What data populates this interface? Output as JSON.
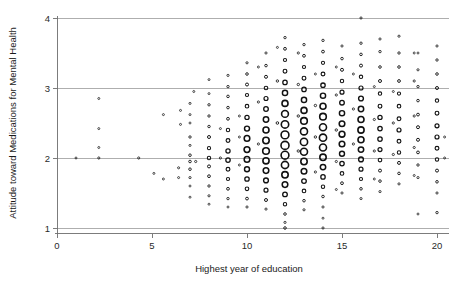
{
  "chart_data": {
    "type": "scatter",
    "title": "",
    "xlabel": "Highest year of education",
    "ylabel": "Attitude toward Medications for Mental Health",
    "xlim": [
      0,
      20.6
    ],
    "ylim": [
      1,
      4
    ],
    "xticks": [
      0,
      5,
      10,
      15,
      20
    ],
    "xticklabels": [
      "0",
      "5",
      "10",
      "15",
      "20"
    ],
    "yticks": [
      1,
      2,
      3,
      4
    ],
    "yticklabels": [
      "1",
      "2",
      "3",
      "4"
    ],
    "grid": "horizontal gridlines at each y tick",
    "legend": "none",
    "marker": "open circle, variable radius (weighted / overplotted)",
    "note": "jittered scatter; density concentrated at education 11-17 and attitude 2.0-3.0",
    "points": [
      [
        1.0,
        2.0,
        2.0
      ],
      [
        2.2,
        2.85,
        2.0
      ],
      [
        2.2,
        2.42,
        2.0
      ],
      [
        2.2,
        2.15,
        2.0
      ],
      [
        2.2,
        2.0,
        2.2
      ],
      [
        4.3,
        2.0,
        2.2
      ],
      [
        5.1,
        1.78,
        2.0
      ],
      [
        5.6,
        2.62,
        2.0
      ],
      [
        5.6,
        1.7,
        2.0
      ],
      [
        6.5,
        2.68,
        2.0
      ],
      [
        6.5,
        2.48,
        2.0
      ],
      [
        6.4,
        1.86,
        2.1
      ],
      [
        6.4,
        1.72,
        2.0
      ],
      [
        7.0,
        2.78,
        2.1
      ],
      [
        7.0,
        2.62,
        2.0
      ],
      [
        7.0,
        2.5,
        2.0
      ],
      [
        7.0,
        2.3,
        2.4
      ],
      [
        7.0,
        2.18,
        2.1
      ],
      [
        7.0,
        2.04,
        2.6
      ],
      [
        7.0,
        1.95,
        2.6
      ],
      [
        7.0,
        1.84,
        2.6
      ],
      [
        7.0,
        1.72,
        2.2
      ],
      [
        7.0,
        1.6,
        2.0
      ],
      [
        7.0,
        1.44,
        2.0
      ],
      [
        7.2,
        2.95,
        2.0
      ],
      [
        7.3,
        1.95,
        2.2
      ],
      [
        8.0,
        3.12,
        2.0
      ],
      [
        8.0,
        2.92,
        2.0
      ],
      [
        8.0,
        2.76,
        2.4
      ],
      [
        8.0,
        2.6,
        2.4
      ],
      [
        8.0,
        2.45,
        2.5
      ],
      [
        8.0,
        2.3,
        3.0
      ],
      [
        8.0,
        2.14,
        3.2
      ],
      [
        8.0,
        2.0,
        3.4
      ],
      [
        8.0,
        1.88,
        3.0
      ],
      [
        8.0,
        1.74,
        2.8
      ],
      [
        8.0,
        1.6,
        2.4
      ],
      [
        8.0,
        1.46,
        2.2
      ],
      [
        8.0,
        1.34,
        2.0
      ],
      [
        8.6,
        2.42,
        2.0
      ],
      [
        8.6,
        2.0,
        2.2
      ],
      [
        9.0,
        3.18,
        2.2
      ],
      [
        9.0,
        3.02,
        2.4
      ],
      [
        9.0,
        2.88,
        2.6
      ],
      [
        9.0,
        2.72,
        2.6
      ],
      [
        9.0,
        2.56,
        2.8
      ],
      [
        9.0,
        2.4,
        3.4
      ],
      [
        9.0,
        2.25,
        3.8
      ],
      [
        9.0,
        2.1,
        4.2
      ],
      [
        9.0,
        1.97,
        4.4
      ],
      [
        9.0,
        1.84,
        3.8
      ],
      [
        9.0,
        1.7,
        3.2
      ],
      [
        9.0,
        1.56,
        2.8
      ],
      [
        9.0,
        1.42,
        2.4
      ],
      [
        9.0,
        1.3,
        2.0
      ],
      [
        9.6,
        2.6,
        2.0
      ],
      [
        9.6,
        2.3,
        2.0
      ],
      [
        9.6,
        1.9,
        2.0
      ],
      [
        10.0,
        3.36,
        2.2
      ],
      [
        10.0,
        3.2,
        2.6
      ],
      [
        10.0,
        3.05,
        3.0
      ],
      [
        10.0,
        2.9,
        3.2
      ],
      [
        10.0,
        2.74,
        3.6
      ],
      [
        10.0,
        2.58,
        4.2
      ],
      [
        10.0,
        2.42,
        5.0
      ],
      [
        10.0,
        2.28,
        5.6
      ],
      [
        10.0,
        2.12,
        5.8
      ],
      [
        10.0,
        1.98,
        5.6
      ],
      [
        10.0,
        1.84,
        5.0
      ],
      [
        10.0,
        1.7,
        4.4
      ],
      [
        10.0,
        1.56,
        3.6
      ],
      [
        10.0,
        1.42,
        2.8
      ],
      [
        10.0,
        1.3,
        2.2
      ],
      [
        10.6,
        3.3,
        2.0
      ],
      [
        10.6,
        2.8,
        2.2
      ],
      [
        10.6,
        2.2,
        2.2
      ],
      [
        11.0,
        3.5,
        2.2
      ],
      [
        11.0,
        3.32,
        2.6
      ],
      [
        11.0,
        3.16,
        3.0
      ],
      [
        11.0,
        3.0,
        3.6
      ],
      [
        11.0,
        2.85,
        4.0
      ],
      [
        11.0,
        2.7,
        4.6
      ],
      [
        11.0,
        2.55,
        5.4
      ],
      [
        11.0,
        2.4,
        6.0
      ],
      [
        11.0,
        2.25,
        6.4
      ],
      [
        11.0,
        2.1,
        6.6
      ],
      [
        11.0,
        1.96,
        6.2
      ],
      [
        11.0,
        1.82,
        5.6
      ],
      [
        11.0,
        1.68,
        4.8
      ],
      [
        11.0,
        1.54,
        4.0
      ],
      [
        11.0,
        1.4,
        3.0
      ],
      [
        11.0,
        1.27,
        2.2
      ],
      [
        11.6,
        3.58,
        2.0
      ],
      [
        11.6,
        3.1,
        2.4
      ],
      [
        11.6,
        2.5,
        2.6
      ],
      [
        12.0,
        3.72,
        2.4
      ],
      [
        12.0,
        3.56,
        2.8
      ],
      [
        12.0,
        3.4,
        3.2
      ],
      [
        12.0,
        3.24,
        3.8
      ],
      [
        12.0,
        3.08,
        4.4
      ],
      [
        12.0,
        2.93,
        5.2
      ],
      [
        12.0,
        2.78,
        6.0
      ],
      [
        12.0,
        2.63,
        6.8
      ],
      [
        12.0,
        2.48,
        7.4
      ],
      [
        12.0,
        2.33,
        7.8
      ],
      [
        12.0,
        2.18,
        8.0
      ],
      [
        12.0,
        2.04,
        7.8
      ],
      [
        12.0,
        1.9,
        7.2
      ],
      [
        12.0,
        1.76,
        6.4
      ],
      [
        12.0,
        1.62,
        5.6
      ],
      [
        12.0,
        1.48,
        4.6
      ],
      [
        12.0,
        1.34,
        3.4
      ],
      [
        12.0,
        1.2,
        2.6
      ],
      [
        12.0,
        1.08,
        2.2
      ],
      [
        12.0,
        1.0,
        2.6
      ],
      [
        12.7,
        3.5,
        2.2
      ],
      [
        12.7,
        3.05,
        2.4
      ],
      [
        12.7,
        2.6,
        2.4
      ],
      [
        12.7,
        2.1,
        2.4
      ],
      [
        13.0,
        3.62,
        2.4
      ],
      [
        13.0,
        3.46,
        2.8
      ],
      [
        13.0,
        3.3,
        3.2
      ],
      [
        13.0,
        3.14,
        3.8
      ],
      [
        13.0,
        2.98,
        4.4
      ],
      [
        13.0,
        2.83,
        5.2
      ],
      [
        13.0,
        2.68,
        6.0
      ],
      [
        13.0,
        2.53,
        6.6
      ],
      [
        13.0,
        2.38,
        7.0
      ],
      [
        13.0,
        2.23,
        7.2
      ],
      [
        13.0,
        2.09,
        7.0
      ],
      [
        13.0,
        1.95,
        6.4
      ],
      [
        13.0,
        1.81,
        5.6
      ],
      [
        13.0,
        1.67,
        4.6
      ],
      [
        13.0,
        1.53,
        3.6
      ],
      [
        13.0,
        1.39,
        2.6
      ],
      [
        13.0,
        1.26,
        2.2
      ],
      [
        13.6,
        3.2,
        2.0
      ],
      [
        13.6,
        2.75,
        2.4
      ],
      [
        13.6,
        2.3,
        2.4
      ],
      [
        13.6,
        1.8,
        2.2
      ],
      [
        14.0,
        3.68,
        2.4
      ],
      [
        14.0,
        3.52,
        2.8
      ],
      [
        14.0,
        3.36,
        3.2
      ],
      [
        14.0,
        3.2,
        3.8
      ],
      [
        14.0,
        3.04,
        4.4
      ],
      [
        14.0,
        2.89,
        5.2
      ],
      [
        14.0,
        2.74,
        6.0
      ],
      [
        14.0,
        2.59,
        6.6
      ],
      [
        14.0,
        2.44,
        7.0
      ],
      [
        14.0,
        2.29,
        7.2
      ],
      [
        14.0,
        2.15,
        7.0
      ],
      [
        14.0,
        2.01,
        6.4
      ],
      [
        14.0,
        1.87,
        5.4
      ],
      [
        14.0,
        1.73,
        4.4
      ],
      [
        14.0,
        1.59,
        3.4
      ],
      [
        14.0,
        1.45,
        2.6
      ],
      [
        14.0,
        1.3,
        2.2
      ],
      [
        14.0,
        1.14,
        2.0
      ],
      [
        14.0,
        1.0,
        2.2
      ],
      [
        14.7,
        3.3,
        2.0
      ],
      [
        14.7,
        2.9,
        2.2
      ],
      [
        14.7,
        2.4,
        2.4
      ],
      [
        14.7,
        1.95,
        2.2
      ],
      [
        14.7,
        1.55,
        2.0
      ],
      [
        15.0,
        3.6,
        2.2
      ],
      [
        15.0,
        3.42,
        2.6
      ],
      [
        15.0,
        3.26,
        3.0
      ],
      [
        15.0,
        3.1,
        3.4
      ],
      [
        15.0,
        2.94,
        4.0
      ],
      [
        15.0,
        2.79,
        4.6
      ],
      [
        15.0,
        2.64,
        5.2
      ],
      [
        15.0,
        2.49,
        5.6
      ],
      [
        15.0,
        2.34,
        5.8
      ],
      [
        15.0,
        2.2,
        5.6
      ],
      [
        15.0,
        2.06,
        5.0
      ],
      [
        15.0,
        1.92,
        4.4
      ],
      [
        15.0,
        1.78,
        3.6
      ],
      [
        15.0,
        1.64,
        2.8
      ],
      [
        15.0,
        1.5,
        2.2
      ],
      [
        15.6,
        3.2,
        2.0
      ],
      [
        15.6,
        2.7,
        2.2
      ],
      [
        15.6,
        2.2,
        2.2
      ],
      [
        16.0,
        4.0,
        2.2
      ],
      [
        16.0,
        3.64,
        2.4
      ],
      [
        16.0,
        3.48,
        2.6
      ],
      [
        16.0,
        3.32,
        3.0
      ],
      [
        16.0,
        3.16,
        3.4
      ],
      [
        16.0,
        3.0,
        4.0
      ],
      [
        16.0,
        2.85,
        4.8
      ],
      [
        16.0,
        2.7,
        5.4
      ],
      [
        16.0,
        2.55,
        6.0
      ],
      [
        16.0,
        2.4,
        6.2
      ],
      [
        16.0,
        2.26,
        6.0
      ],
      [
        16.0,
        2.12,
        5.4
      ],
      [
        16.0,
        1.98,
        4.8
      ],
      [
        16.0,
        1.84,
        4.0
      ],
      [
        16.0,
        1.7,
        3.2
      ],
      [
        16.0,
        1.56,
        2.6
      ],
      [
        16.0,
        1.42,
        2.2
      ],
      [
        16.7,
        3.02,
        2.0
      ],
      [
        16.7,
        2.55,
        2.2
      ],
      [
        16.7,
        2.1,
        2.2
      ],
      [
        16.7,
        1.7,
        2.0
      ],
      [
        17.0,
        3.7,
        2.2
      ],
      [
        17.0,
        3.52,
        2.4
      ],
      [
        17.0,
        3.3,
        2.6
      ],
      [
        17.0,
        3.1,
        3.0
      ],
      [
        17.0,
        2.92,
        3.4
      ],
      [
        17.0,
        2.74,
        3.8
      ],
      [
        17.0,
        2.58,
        4.2
      ],
      [
        17.0,
        2.42,
        4.4
      ],
      [
        17.0,
        2.27,
        4.4
      ],
      [
        17.0,
        2.12,
        4.0
      ],
      [
        17.0,
        1.97,
        3.6
      ],
      [
        17.0,
        1.82,
        3.0
      ],
      [
        17.0,
        1.67,
        2.6
      ],
      [
        17.0,
        1.52,
        2.2
      ],
      [
        17.7,
        2.95,
        2.0
      ],
      [
        17.7,
        2.5,
        2.2
      ],
      [
        17.7,
        2.05,
        2.2
      ],
      [
        18.0,
        3.74,
        2.2
      ],
      [
        18.0,
        3.5,
        2.4
      ],
      [
        18.0,
        3.3,
        2.6
      ],
      [
        18.0,
        3.1,
        2.8
      ],
      [
        18.0,
        2.92,
        3.2
      ],
      [
        18.0,
        2.74,
        3.6
      ],
      [
        18.0,
        2.56,
        3.8
      ],
      [
        18.0,
        2.4,
        4.0
      ],
      [
        18.0,
        2.24,
        3.8
      ],
      [
        18.0,
        2.08,
        3.4
      ],
      [
        18.0,
        1.93,
        3.0
      ],
      [
        18.0,
        1.78,
        2.6
      ],
      [
        18.0,
        1.63,
        2.2
      ],
      [
        18.8,
        3.5,
        2.0
      ],
      [
        18.8,
        3.1,
        2.2
      ],
      [
        18.8,
        2.6,
        2.2
      ],
      [
        18.8,
        2.15,
        2.2
      ],
      [
        18.8,
        1.75,
        2.0
      ],
      [
        19.0,
        3.5,
        2.0
      ],
      [
        19.0,
        3.26,
        2.2
      ],
      [
        19.0,
        3.02,
        2.4
      ],
      [
        19.0,
        2.82,
        2.6
      ],
      [
        19.0,
        2.62,
        2.8
      ],
      [
        19.0,
        2.44,
        3.0
      ],
      [
        19.0,
        2.26,
        3.0
      ],
      [
        19.0,
        2.08,
        2.8
      ],
      [
        19.0,
        1.9,
        2.4
      ],
      [
        19.0,
        1.72,
        2.2
      ],
      [
        19.0,
        1.2,
        2.0
      ],
      [
        20.0,
        3.6,
        2.2
      ],
      [
        20.0,
        3.4,
        2.4
      ],
      [
        20.0,
        3.2,
        2.6
      ],
      [
        20.0,
        3.0,
        3.0
      ],
      [
        20.0,
        2.82,
        3.4
      ],
      [
        20.0,
        2.64,
        3.8
      ],
      [
        20.0,
        2.46,
        4.0
      ],
      [
        20.0,
        2.3,
        4.0
      ],
      [
        20.0,
        2.14,
        3.8
      ],
      [
        20.0,
        1.98,
        3.4
      ],
      [
        20.0,
        1.82,
        3.0
      ],
      [
        20.0,
        1.66,
        2.6
      ],
      [
        20.0,
        1.5,
        2.2
      ],
      [
        20.0,
        1.22,
        2.4
      ],
      [
        20.4,
        2.3,
        2.0
      ],
      [
        20.4,
        2.0,
        2.0
      ]
    ]
  }
}
